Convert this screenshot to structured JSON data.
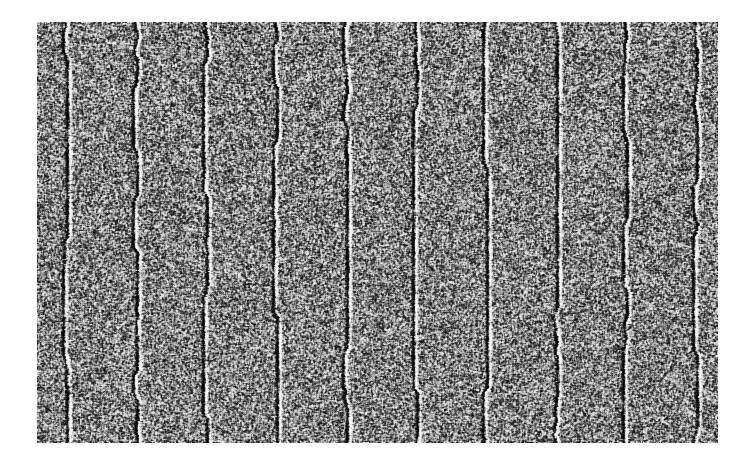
{
  "figure": {
    "kind": "grayscale-noise-texture-image",
    "background_color": "#ffffff"
  },
  "image_panel": {
    "name": "noise-texture-image",
    "x": 37,
    "y": 22,
    "width": 681,
    "height": 421,
    "alt_text": "Grainy black and white speckle noise image with evenly spaced vertical streaks"
  },
  "chart_data": {
    "type": "heatmap",
    "title": "",
    "subtitle": "",
    "xlabel": "",
    "ylabel": "",
    "grid": false,
    "legend": "none",
    "colormap": "grayscale",
    "value_range": [
      0,
      255
    ],
    "render": {
      "grain_size_px": 1,
      "base_gray": 128,
      "noise_contrast": 1.0,
      "binarization_strength": 0.82,
      "smoothing_radius_px": 1,
      "seed": 20240517
    },
    "vertical_features": {
      "count": 10,
      "spacing_px": 70,
      "first_center_px": 28,
      "dark_line": {
        "width_px": 2,
        "intensity_offset": -95
      },
      "bright_line": {
        "width_px": 2,
        "offset_from_dark_px": 3,
        "intensity_offset": 95
      },
      "jitter_amplitude_px": 2,
      "centers_px": [
        28,
        98,
        168,
        238,
        308,
        378,
        448,
        518,
        588,
        658
      ]
    },
    "row_bands": {
      "count": 0
    }
  }
}
